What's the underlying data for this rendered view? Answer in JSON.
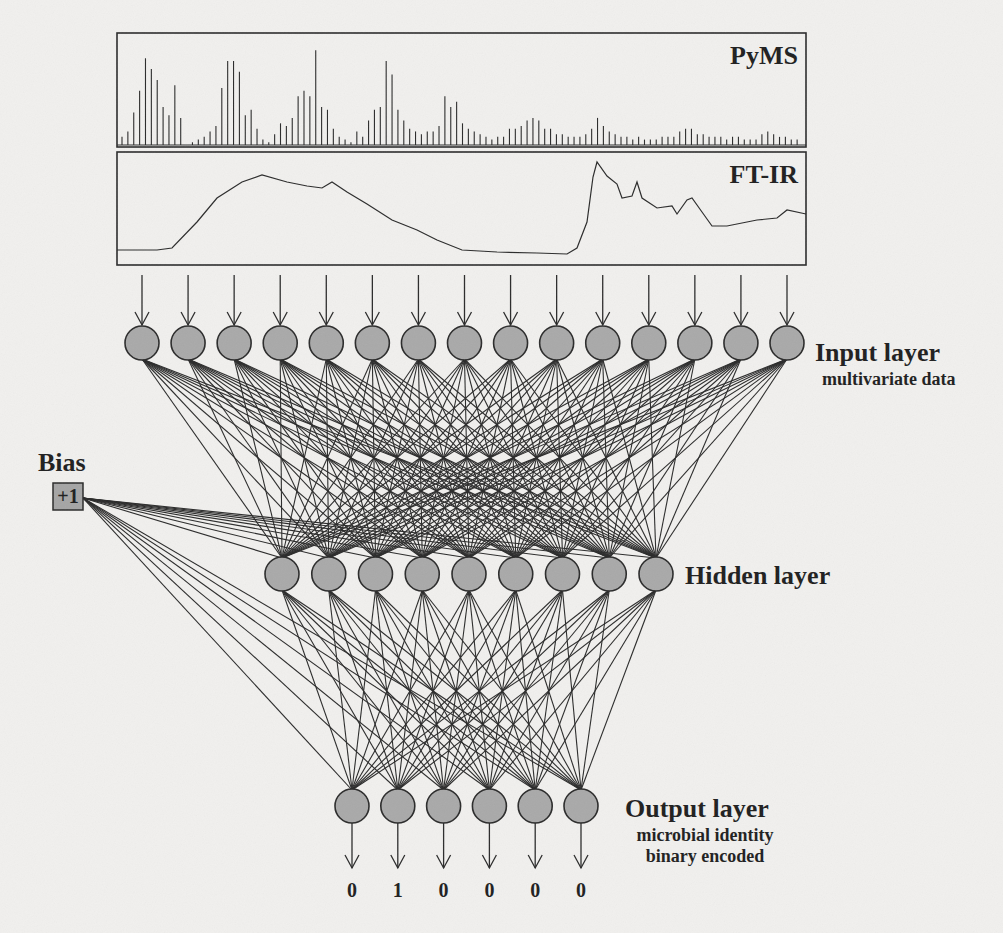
{
  "colors": {
    "background": "#f1f0ee",
    "stroke": "#2a2a2a",
    "node_fill": "#a9a9a9",
    "bias_fill": "#a5a5a5"
  },
  "spectra": {
    "pyms": {
      "label": "PyMS",
      "box": {
        "x": 117,
        "y": 33,
        "w": 689,
        "h": 114
      },
      "peaks": [
        3,
        5,
        12,
        20,
        32,
        28,
        24,
        14,
        11,
        22,
        10,
        0,
        1,
        2,
        3,
        5,
        7,
        21,
        31,
        31,
        27,
        11,
        13,
        6,
        2,
        1,
        4,
        8,
        7,
        10,
        18,
        20,
        18,
        35,
        14,
        13,
        6,
        3,
        2,
        1,
        5,
        3,
        9,
        13,
        14,
        31,
        26,
        13,
        9,
        6,
        5,
        4,
        5,
        5,
        7,
        18,
        14,
        16,
        8,
        6,
        5,
        4,
        3,
        2,
        3,
        3,
        6,
        6,
        7,
        9,
        10,
        9,
        6,
        6,
        4,
        4,
        3,
        3,
        3,
        4,
        6,
        10,
        7,
        5,
        4,
        3,
        3,
        2,
        3,
        2,
        2,
        2,
        3,
        3,
        3,
        5,
        6,
        6,
        4,
        4,
        3,
        3,
        3,
        2,
        3,
        3,
        2,
        2,
        2,
        4,
        5,
        4,
        3,
        3,
        2,
        2
      ]
    },
    "ftir": {
      "label": "FT-IR",
      "box": {
        "x": 117,
        "y": 152,
        "w": 689,
        "h": 113
      },
      "curve": [
        [
          0,
          98
        ],
        [
          40,
          98
        ],
        [
          55,
          96
        ],
        [
          80,
          70
        ],
        [
          100,
          46
        ],
        [
          125,
          30
        ],
        [
          145,
          23
        ],
        [
          170,
          30
        ],
        [
          190,
          34
        ],
        [
          205,
          36
        ],
        [
          215,
          30
        ],
        [
          230,
          40
        ],
        [
          250,
          52
        ],
        [
          275,
          68
        ],
        [
          300,
          78
        ],
        [
          320,
          88
        ],
        [
          345,
          98
        ],
        [
          380,
          100
        ],
        [
          420,
          101
        ],
        [
          450,
          102
        ],
        [
          460,
          96
        ],
        [
          470,
          70
        ],
        [
          476,
          25
        ],
        [
          480,
          10
        ],
        [
          490,
          24
        ],
        [
          500,
          32
        ],
        [
          505,
          46
        ],
        [
          515,
          44
        ],
        [
          520,
          30
        ],
        [
          525,
          46
        ],
        [
          540,
          56
        ],
        [
          555,
          54
        ],
        [
          560,
          62
        ],
        [
          570,
          48
        ],
        [
          575,
          46
        ],
        [
          585,
          60
        ],
        [
          595,
          74
        ],
        [
          610,
          74
        ],
        [
          640,
          68
        ],
        [
          660,
          66
        ],
        [
          670,
          58
        ],
        [
          689,
          62
        ]
      ]
    }
  },
  "network": {
    "input_layer": {
      "title": "Input layer",
      "subtitle": "multivariate data",
      "count": 15,
      "x_start": 142,
      "x_end": 787,
      "y": 343,
      "r": 17,
      "arrow_top": 275
    },
    "hidden_layer": {
      "title": "Hidden layer",
      "count": 9,
      "x_start": 282,
      "x_end": 656,
      "y": 574,
      "r": 17
    },
    "output_layer": {
      "title": "Output layer",
      "subtitle_lines": [
        "microbial identity",
        "binary encoded"
      ],
      "count": 6,
      "x_start": 352,
      "x_end": 581,
      "y": 806,
      "r": 17,
      "arrow_bottom": 868,
      "values": [
        "0",
        "1",
        "0",
        "0",
        "0",
        "0"
      ]
    },
    "bias": {
      "title": "Bias",
      "value": "+1",
      "box": {
        "x": 53,
        "y": 483,
        "w": 30,
        "h": 27
      }
    }
  }
}
